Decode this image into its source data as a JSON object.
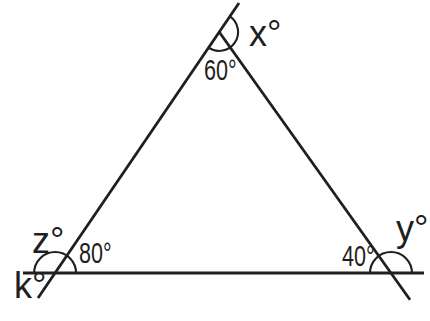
{
  "colors": {
    "ink": "#1f1f1f",
    "background": "#ffffff"
  },
  "figure": {
    "labels": {
      "top_exterior": "x°",
      "top_interior": "60°",
      "bottom_left_exterior_upper": "z°",
      "bottom_left_interior": "80°",
      "bottom_left_exterior_lower": "k°",
      "bottom_right_interior": "40°",
      "bottom_right_exterior": "y°"
    },
    "given_angle_values": {
      "top_interior_deg": 60,
      "bottom_left_interior_deg": 80,
      "bottom_right_interior_deg": 40
    },
    "unknown_angle_names": [
      "x",
      "y",
      "z",
      "k"
    ]
  }
}
